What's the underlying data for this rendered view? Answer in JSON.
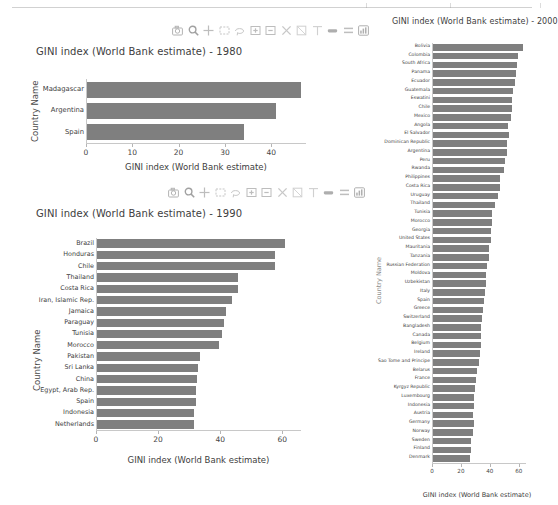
{
  "page": {
    "background": "#ffffff",
    "bar_color": "#7f7f7f",
    "axis_color": "#c8c8c8"
  },
  "modebar": {
    "buttons": [
      {
        "name": "download-plot-icon",
        "label": "Download plot as a png"
      },
      {
        "name": "zoom-icon",
        "label": "Zoom"
      },
      {
        "name": "pan-icon",
        "label": "Pan"
      },
      {
        "name": "box-select-icon",
        "label": "Box Select"
      },
      {
        "name": "lasso-select-icon",
        "label": "Lasso Select"
      },
      {
        "name": "zoom-in-icon",
        "label": "Zoom in"
      },
      {
        "name": "zoom-out-icon",
        "label": "Zoom out"
      },
      {
        "name": "autoscale-icon",
        "label": "Autoscale"
      },
      {
        "name": "reset-axes-icon",
        "label": "Reset axes"
      },
      {
        "name": "toggle-spikelines-icon",
        "label": "Toggle Spike Lines"
      },
      {
        "name": "hover-compare-icon",
        "label": "Show closest data on hover"
      },
      {
        "name": "hover-closest-icon",
        "label": "Compare data on hover"
      },
      {
        "name": "plotly-logo-icon",
        "label": "Produced with Plotly"
      }
    ]
  },
  "chart_data": [
    {
      "id": "gini-1980",
      "type": "bar",
      "orientation": "horizontal",
      "title": "GINI index (World Bank estimate) - 1980",
      "xlabel": "GINI index (World Bank estimate)",
      "ylabel": "Country Name",
      "xlim": [
        0,
        47.5
      ],
      "xticks": [
        0,
        10,
        20,
        30,
        40
      ],
      "grid": false,
      "legend": "none",
      "categories": [
        "Madagascar",
        "Argentina",
        "Spain"
      ],
      "values": [
        46.1,
        40.8,
        33.9
      ]
    },
    {
      "id": "gini-1990",
      "type": "bar",
      "orientation": "horizontal",
      "title": "GINI index (World Bank estimate) - 1990",
      "xlabel": "GINI index (World Bank estimate)",
      "ylabel": "Country Name",
      "xlim": [
        0,
        66
      ],
      "xticks": [
        0,
        20,
        40,
        60
      ],
      "grid": false,
      "legend": "none",
      "categories": [
        "Brazil",
        "Honduras",
        "Chile",
        "Thailand",
        "Costa Rica",
        "Iran, Islamic Rep.",
        "Jamaica",
        "Paraguay",
        "Tunisia",
        "Morocco",
        "Pakistan",
        "Sri Lanka",
        "China",
        "Egypt, Arab Rep.",
        "Spain",
        "Indonesia",
        "Netherlands"
      ],
      "values": [
        60.5,
        57.4,
        57.2,
        45.3,
        45.4,
        43.6,
        41.4,
        40.8,
        40.2,
        39.2,
        33.3,
        32.5,
        32.2,
        32.0,
        32.0,
        31.2,
        31.1
      ]
    },
    {
      "id": "gini-2000",
      "type": "bar",
      "orientation": "horizontal",
      "title": "GINI index (World Bank estimate) - 2000",
      "xlabel": "GINI index (World Bank estimate)",
      "ylabel": "Country Name",
      "xlim": [
        0,
        65
      ],
      "xticks": [
        0,
        20,
        40,
        60
      ],
      "grid": false,
      "legend": "none",
      "categories": [
        "Bolivia",
        "Colombia",
        "South Africa",
        "Panama",
        "Ecuador",
        "Guatemala",
        "Eswatini",
        "Chile",
        "Mexico",
        "Angola",
        "El Salvador",
        "Dominican Republic",
        "Argentina",
        "Peru",
        "Rwanda",
        "Philippines",
        "Costa Rica",
        "Uruguay",
        "Thailand",
        "Tunisia",
        "Morocco",
        "Georgia",
        "United States",
        "Mauritania",
        "Tanzania",
        "Russian Federation",
        "Moldova",
        "Uzbekistan",
        "Italy",
        "Spain",
        "Greece",
        "Switzerland",
        "Bangladesh",
        "Canada",
        "Belgium",
        "Ireland",
        "Sao Tome and Principe",
        "Belarus",
        "France",
        "Kyrgyz Republic",
        "Luxembourg",
        "Indonesia",
        "Austria",
        "Germany",
        "Norway",
        "Sweden",
        "Finland",
        "Denmark"
      ],
      "values": [
        62.0,
        58.7,
        57.8,
        57.1,
        56.9,
        55.4,
        54.5,
        54.9,
        53.6,
        52.0,
        52.5,
        51.5,
        51.1,
        49.9,
        49.0,
        46.0,
        46.4,
        44.8,
        42.8,
        41.0,
        40.7,
        40.4,
        40.1,
        39.0,
        38.6,
        37.1,
        36.9,
        36.8,
        36.0,
        35.0,
        34.3,
        34.0,
        33.4,
        33.3,
        33.0,
        32.8,
        32.0,
        30.4,
        29.8,
        29.0,
        28.5,
        28.6,
        28.0,
        28.2,
        27.4,
        26.0,
        26.5,
        25.5
      ]
    }
  ]
}
